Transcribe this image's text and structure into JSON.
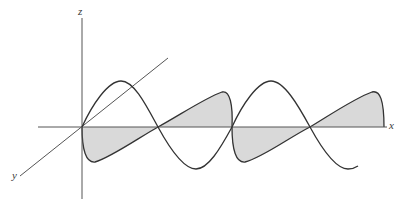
{
  "diagram": {
    "axes": {
      "x_label": "x",
      "y_label": "y",
      "z_label": "z"
    },
    "colors": {
      "line": "#333333",
      "axis": "#555555",
      "shade": "#d9d9d9",
      "background": "#ffffff"
    },
    "waves": [
      {
        "name": "vertical-plane-wave",
        "shaded": false,
        "zero_crossings_px": [
          82,
          158,
          232,
          310
        ]
      },
      {
        "name": "horizontal-plane-wave",
        "shaded": true,
        "zero_crossings_px": [
          82,
          158,
          232,
          310
        ]
      }
    ]
  }
}
